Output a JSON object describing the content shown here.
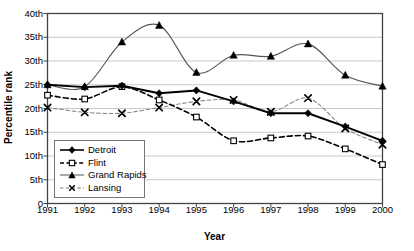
{
  "chart_data": {
    "type": "line",
    "title": "",
    "xlabel": "Year",
    "ylabel": "Percentile rank",
    "x": [
      1991,
      1992,
      1993,
      1994,
      1995,
      1996,
      1997,
      1998,
      1999,
      2000
    ],
    "categories": [
      "1991",
      "1992",
      "1993",
      "1994",
      "1995",
      "1996",
      "1997",
      "1998",
      "1999",
      "2000"
    ],
    "xlim": [
      1991,
      2000
    ],
    "ylim": [
      0,
      40
    ],
    "ytick_values": [
      0,
      5,
      10,
      15,
      20,
      25,
      30,
      35,
      40
    ],
    "ytick_labels": [
      "0",
      "5th",
      "10th",
      "15th",
      "20th",
      "25th",
      "30th",
      "35th",
      "40th"
    ],
    "grid": "horizontal",
    "legend_position": "inside-lower-left",
    "series": [
      {
        "name": "Detroit",
        "marker": "filled-diamond",
        "line_style": "solid",
        "color": "#000000",
        "values": [
          25.0,
          24.5,
          24.8,
          23.2,
          23.8,
          21.5,
          19.0,
          19.0,
          16.2,
          13.2
        ]
      },
      {
        "name": "Flint",
        "marker": "open-square",
        "line_style": "dashed",
        "color": "#000000",
        "values": [
          22.8,
          22.0,
          24.6,
          21.8,
          18.2,
          13.2,
          13.8,
          14.2,
          11.5,
          8.2
        ]
      },
      {
        "name": "Grand Rapids",
        "marker": "filled-triangle",
        "line_style": "solid",
        "color": "#000000",
        "values": [
          25.0,
          24.6,
          34.0,
          37.5,
          27.6,
          31.2,
          31.0,
          33.6,
          27.0,
          24.7
        ]
      },
      {
        "name": "Lansing",
        "marker": "cross-x",
        "line_style": "dashed",
        "color": "#666666",
        "values": [
          20.2,
          19.2,
          19.0,
          20.2,
          21.5,
          21.8,
          19.3,
          22.2,
          15.8,
          12.4
        ]
      }
    ]
  },
  "axis": {
    "y_title": "Percentile rank",
    "x_title": "Year"
  },
  "legend": {
    "items": [
      {
        "label": "Detroit",
        "key": "filled-diamond-solid"
      },
      {
        "label": "Flint",
        "key": "open-square-dashed"
      },
      {
        "label": "Grand Rapids",
        "key": "filled-triangle-solid"
      },
      {
        "label": "Lansing",
        "key": "cross-x-dashed"
      }
    ]
  }
}
